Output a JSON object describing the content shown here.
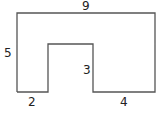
{
  "diagram": {
    "type": "composite-shape",
    "labels": {
      "top": "9",
      "left": "5",
      "notch_height": "3",
      "bottom_left": "2",
      "bottom_right": "4"
    },
    "stroke_color": "#555555"
  }
}
